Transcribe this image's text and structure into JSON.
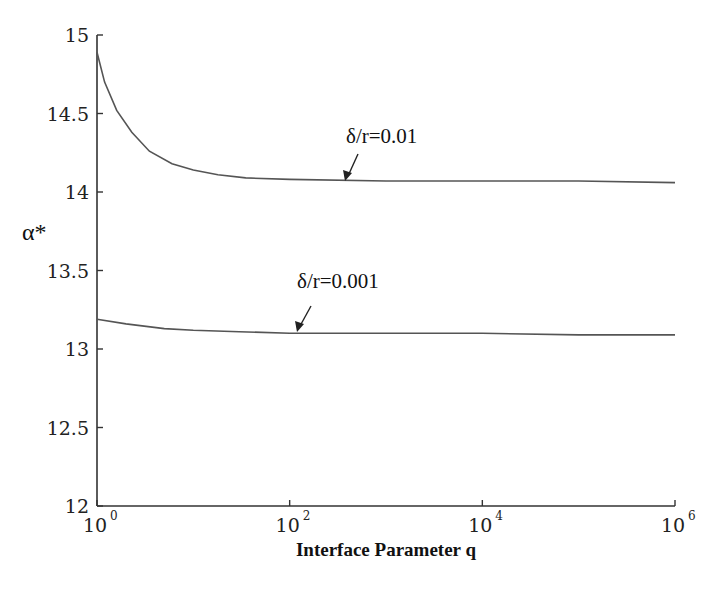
{
  "chart_data": {
    "type": "line",
    "title": "",
    "xlabel": "Interface Parameter q",
    "ylabel": "α*",
    "xscale": "log",
    "xlim": [
      1,
      1000000
    ],
    "ylim": [
      12,
      15
    ],
    "grid": false,
    "legend": "none (inline annotations with arrows)",
    "x_ticks": [
      {
        "base": "10",
        "exp": "0"
      },
      {
        "base": "10",
        "exp": "2"
      },
      {
        "base": "10",
        "exp": "4"
      },
      {
        "base": "10",
        "exp": "6"
      }
    ],
    "y_ticks": [
      "12",
      "12.5",
      "13",
      "13.5",
      "14",
      "14.5",
      "15"
    ],
    "series": [
      {
        "name": "δ/r=0.01",
        "x": [
          1,
          1.2,
          1.6,
          2.3,
          3.5,
          6,
          10,
          18,
          35,
          100,
          1000,
          10000,
          100000,
          1000000
        ],
        "y": [
          14.89,
          14.7,
          14.52,
          14.38,
          14.26,
          14.18,
          14.14,
          14.11,
          14.09,
          14.08,
          14.07,
          14.07,
          14.07,
          14.06
        ]
      },
      {
        "name": "δ/r=0.001",
        "x": [
          1,
          2,
          5,
          10,
          30,
          100,
          1000,
          10000,
          100000,
          1000000
        ],
        "y": [
          13.19,
          13.16,
          13.13,
          13.12,
          13.11,
          13.1,
          13.1,
          13.1,
          13.09,
          13.09
        ]
      }
    ],
    "annotations": [
      {
        "text": "δ/r=0.01",
        "arrow_to_x": 300,
        "arrow_to_y": 14.08
      },
      {
        "text": "δ/r=0.001",
        "arrow_to_x": 100,
        "arrow_to_y": 13.1
      }
    ]
  },
  "labels": {
    "xlabel": "Interface Parameter q",
    "ylabel": "α*",
    "annot_top": "δ/r=0.01",
    "annot_bottom": "δ/r=0.001"
  }
}
